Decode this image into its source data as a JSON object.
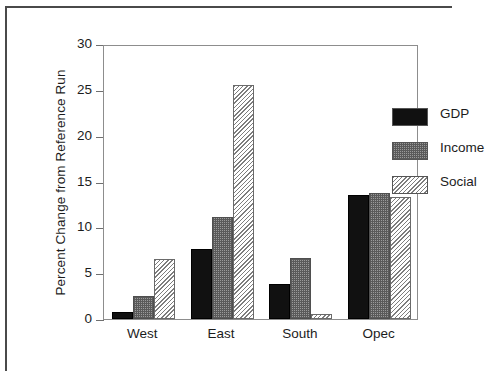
{
  "chart_data": {
    "type": "bar",
    "title": "",
    "xlabel": "",
    "ylabel": "Percent Change from Reference Run",
    "categories": [
      "West",
      "East",
      "South",
      "Opec"
    ],
    "series": [
      {
        "name": "GDP",
        "values": [
          0.8,
          7.6,
          3.8,
          13.5
        ]
      },
      {
        "name": "Income",
        "values": [
          2.5,
          11.1,
          6.7,
          13.8
        ]
      },
      {
        "name": "Social",
        "values": [
          6.5,
          25.5,
          0.5,
          13.3
        ]
      }
    ],
    "ylim": [
      0,
      30
    ],
    "yticks": [
      0,
      5,
      10,
      15,
      20,
      25,
      30
    ],
    "ytick_labels": [
      "0",
      "5",
      "10",
      "15",
      "20",
      "25",
      "30"
    ],
    "grid": false,
    "legend_position": "upper right",
    "colors": {
      "GDP": "#111111",
      "Income": "#9a9a9a",
      "Social": "#cfcfcf",
      "axis": "#8d8d8d",
      "text": "#1c1c1c",
      "frame": "#4a4a4a"
    }
  },
  "legend": {
    "items": [
      {
        "label": "GDP"
      },
      {
        "label": "Income"
      },
      {
        "label": "Social"
      }
    ]
  }
}
